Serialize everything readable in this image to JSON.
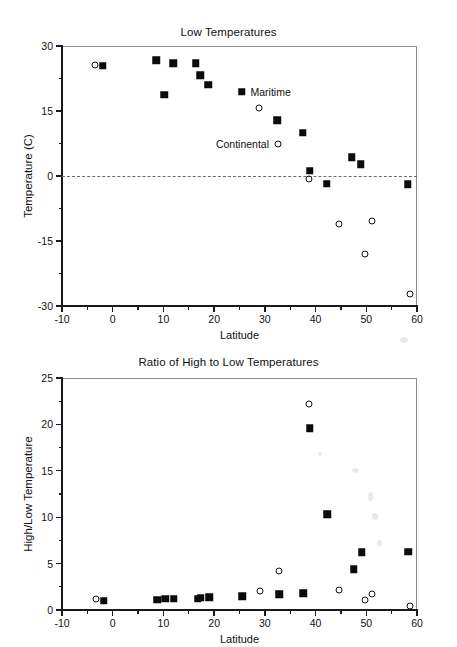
{
  "figures": [
    {
      "id": "low-temperatures",
      "title": "Low Temperatures",
      "xlabel": "Latitude",
      "ylabel": "Temperature (C)"
    },
    {
      "id": "ratio-high-low",
      "title": "Ratio of High to Low Temperatures",
      "xlabel": "Latitude",
      "ylabel": "High/Low Temperature"
    }
  ],
  "annotations": {
    "maritime": "Maritime",
    "continental": "Continental"
  },
  "chart_data": [
    {
      "type": "scatter",
      "title": "Low Temperatures",
      "xlabel": "Latitude",
      "ylabel": "Temperature (C)",
      "xlim": [
        -10,
        60
      ],
      "ylim": [
        -30,
        30
      ],
      "xticks": [
        -10,
        0,
        10,
        20,
        30,
        40,
        50,
        60
      ],
      "yticks": [
        30,
        15,
        0,
        -15,
        -30
      ],
      "xtick_labels": [
        "-10",
        "0",
        "10",
        "20",
        "30",
        "40",
        "50",
        "60"
      ],
      "ytick_labels": [
        "30",
        "15",
        "0",
        "-15",
        "-30"
      ],
      "minor_ticks": true,
      "grid": false,
      "reference_lines": [
        {
          "axis": "y",
          "value": 0,
          "style": "dashed"
        }
      ],
      "legend_position": "inline-annotation",
      "series": [
        {
          "name": "Maritime",
          "marker": "filled-square",
          "color": "#0b0b0b",
          "points": [
            {
              "x": -2.0,
              "y": 25.4
            },
            {
              "x": 8.6,
              "y": 26.7
            },
            {
              "x": 10.2,
              "y": 18.8
            },
            {
              "x": 11.9,
              "y": 26.0
            },
            {
              "x": 16.4,
              "y": 26.0
            },
            {
              "x": 17.3,
              "y": 23.3
            },
            {
              "x": 18.8,
              "y": 21.1
            },
            {
              "x": 25.4,
              "y": 19.5
            },
            {
              "x": 32.4,
              "y": 12.9
            },
            {
              "x": 37.5,
              "y": 10.0
            },
            {
              "x": 38.9,
              "y": 1.2
            },
            {
              "x": 42.2,
              "y": -1.8
            },
            {
              "x": 47.1,
              "y": 4.3
            },
            {
              "x": 48.9,
              "y": 2.7
            },
            {
              "x": 58.2,
              "y": -1.9
            }
          ]
        },
        {
          "name": "Continental",
          "marker": "open-circle",
          "color": "#101010",
          "points": [
            {
              "x": -3.4,
              "y": 25.7
            },
            {
              "x": 28.9,
              "y": 15.8
            },
            {
              "x": 32.6,
              "y": 7.4
            },
            {
              "x": 38.7,
              "y": -0.8
            },
            {
              "x": 44.6,
              "y": -11.0
            },
            {
              "x": 49.8,
              "y": -18.1
            },
            {
              "x": 51.2,
              "y": -10.4
            },
            {
              "x": 58.6,
              "y": -27.3
            }
          ]
        }
      ],
      "annotations": [
        {
          "text": "Maritime",
          "x": 25.4,
          "y": 19.5,
          "align": "right-of-marker"
        },
        {
          "text": "Continental",
          "x": 32.6,
          "y": 7.4,
          "align": "left-of-marker"
        }
      ]
    },
    {
      "type": "scatter",
      "title": "Ratio of High to Low Temperatures",
      "xlabel": "Latitude",
      "ylabel": "High/Low Temperature",
      "xlim": [
        -10,
        60
      ],
      "ylim": [
        0,
        25
      ],
      "xticks": [
        -10,
        0,
        10,
        20,
        30,
        40,
        50,
        60
      ],
      "yticks": [
        0,
        5,
        10,
        15,
        20,
        25
      ],
      "xtick_labels": [
        "-10",
        "0",
        "10",
        "20",
        "30",
        "40",
        "50",
        "60"
      ],
      "ytick_labels": [
        "0",
        "5",
        "10",
        "15",
        "20",
        "25"
      ],
      "minor_ticks": true,
      "grid": false,
      "legend_position": "none",
      "series": [
        {
          "name": "Maritime",
          "marker": "filled-square",
          "color": "#0b0b0b",
          "points": [
            {
              "x": -1.8,
              "y": 1.0
            },
            {
              "x": 8.8,
              "y": 1.1
            },
            {
              "x": 10.4,
              "y": 1.2
            },
            {
              "x": 12.0,
              "y": 1.2
            },
            {
              "x": 16.8,
              "y": 1.2
            },
            {
              "x": 17.4,
              "y": 1.3
            },
            {
              "x": 19.0,
              "y": 1.4
            },
            {
              "x": 25.5,
              "y": 1.5
            },
            {
              "x": 32.8,
              "y": 1.7
            },
            {
              "x": 37.6,
              "y": 1.8
            },
            {
              "x": 38.9,
              "y": 19.6
            },
            {
              "x": 42.3,
              "y": 10.3
            },
            {
              "x": 47.5,
              "y": 4.4
            },
            {
              "x": 49.1,
              "y": 6.2
            },
            {
              "x": 58.3,
              "y": 6.3
            }
          ]
        },
        {
          "name": "Continental",
          "marker": "open-circle",
          "color": "#101010",
          "points": [
            {
              "x": -3.2,
              "y": 1.2
            },
            {
              "x": 29.0,
              "y": 2.1
            },
            {
              "x": 32.7,
              "y": 4.2
            },
            {
              "x": 38.8,
              "y": 22.2
            },
            {
              "x": 44.7,
              "y": 2.2
            },
            {
              "x": 49.8,
              "y": 1.1
            },
            {
              "x": 51.1,
              "y": 1.7
            },
            {
              "x": 58.7,
              "y": 0.4
            }
          ]
        }
      ]
    }
  ]
}
